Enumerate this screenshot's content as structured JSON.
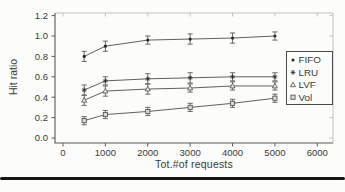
{
  "figure": {
    "background": "#fcfcfb",
    "text_color": "#3a3a3a",
    "axis_color": "#5a5a5a",
    "frame_light_color": "#c2c2c2",
    "line_color": "#4d4d4d",
    "marker_color": "#2a2a2a",
    "bottom_rule_color": "#161616"
  },
  "chart_data": {
    "type": "line",
    "title": "",
    "xlabel": "Tot.#of requests",
    "ylabel": "Hit ratio",
    "x": [
      500,
      1000,
      2000,
      3000,
      4000,
      5000
    ],
    "xticks": [
      0,
      1000,
      2000,
      3000,
      4000,
      5000,
      6000
    ],
    "xtick_labels": [
      "0",
      "1000",
      "2000",
      "3000",
      "4000",
      "5000",
      "6000"
    ],
    "yticks": [
      0.0,
      0.2,
      0.4,
      0.6,
      0.8,
      1.0,
      1.2
    ],
    "ytick_labels": [
      "0.0",
      "0.2",
      "0.4",
      "0.6",
      "0.8",
      "1.0",
      "1.2"
    ],
    "xlim": [
      -200,
      6350
    ],
    "ylim": [
      -0.05,
      1.22
    ],
    "grid": false,
    "error_bars": true,
    "legend_position": "right-inside",
    "series": [
      {
        "name": "FIFO",
        "marker": "dot",
        "values": [
          0.8,
          0.9,
          0.96,
          0.97,
          0.98,
          1.0
        ],
        "yerr": [
          0.05,
          0.05,
          0.04,
          0.05,
          0.05,
          0.04
        ]
      },
      {
        "name": "LRU",
        "marker": "asterisk",
        "values": [
          0.47,
          0.56,
          0.58,
          0.59,
          0.6,
          0.6
        ],
        "yerr": [
          0.05,
          0.04,
          0.05,
          0.05,
          0.04,
          0.04
        ]
      },
      {
        "name": "LVF",
        "marker": "triangle",
        "values": [
          0.37,
          0.46,
          0.48,
          0.49,
          0.51,
          0.51
        ],
        "yerr": [
          0.05,
          0.05,
          0.05,
          0.04,
          0.04,
          0.04
        ]
      },
      {
        "name": "Vol",
        "marker": "square",
        "values": [
          0.17,
          0.23,
          0.26,
          0.3,
          0.34,
          0.39
        ],
        "yerr": [
          0.04,
          0.04,
          0.04,
          0.04,
          0.04,
          0.04
        ]
      }
    ]
  }
}
